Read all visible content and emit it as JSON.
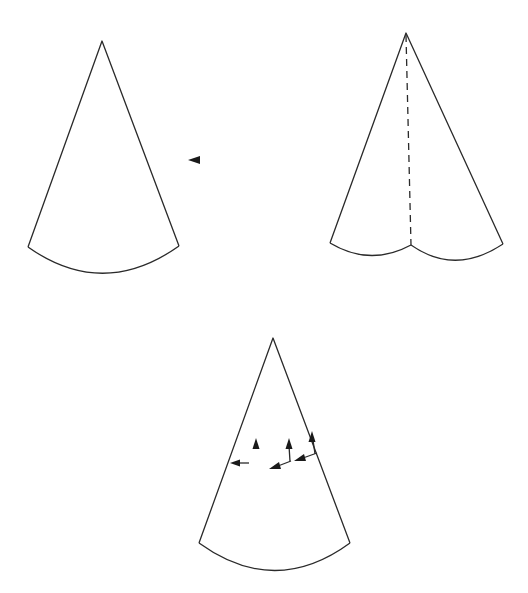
{
  "figure": {
    "colors": {
      "line": "#2a2a2a",
      "background": "#ffffff"
    },
    "cones": [
      {
        "id": "cone-plain",
        "apex": [
          102,
          41
        ],
        "base_left": [
          28,
          247
        ],
        "base_right": [
          179,
          246
        ],
        "arc_bottom_y": 274
      },
      {
        "id": "cone-folded",
        "apex": [
          406,
          33
        ],
        "base_left": [
          330,
          243
        ],
        "cusp": [
          411,
          245
        ],
        "base_right": [
          503,
          244
        ],
        "fold_line": "dashed"
      },
      {
        "id": "cone-arrows",
        "apex": [
          273,
          338
        ],
        "base_left": [
          199,
          543
        ],
        "base_right": [
          350,
          543
        ],
        "arc_bottom_y": 571
      }
    ],
    "pointer": {
      "icon": "triangle-left-icon",
      "position": [
        194,
        160
      ]
    },
    "arrows": [
      {
        "from": [
          249,
          463
        ],
        "to": [
          231,
          463
        ],
        "dir": "left"
      },
      {
        "from": [
          256,
          455
        ],
        "to": [
          256,
          438
        ],
        "dir": "up"
      },
      {
        "from": [
          289,
          460
        ],
        "to": [
          289,
          438
        ],
        "dir": "up"
      },
      {
        "from": [
          291,
          461
        ],
        "to": [
          270,
          468
        ],
        "dir": "down-left"
      },
      {
        "from": [
          316,
          453
        ],
        "to": [
          295,
          460
        ],
        "dir": "down-left"
      },
      {
        "from": [
          314,
          453
        ],
        "to": [
          312,
          432
        ],
        "dir": "up"
      }
    ]
  }
}
